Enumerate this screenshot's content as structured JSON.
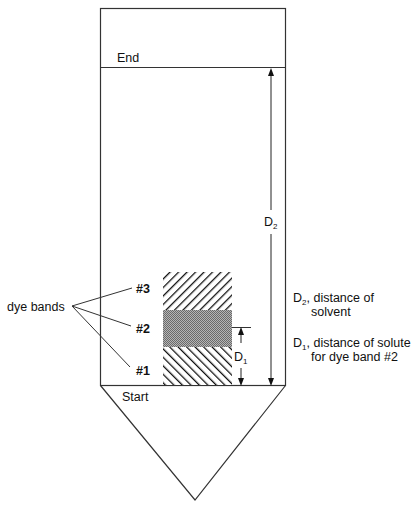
{
  "diagram": {
    "type": "paper-chromatography-strip",
    "labels": {
      "end": "End",
      "start": "Start",
      "dye_bands": "dye bands",
      "band_1": "#1",
      "band_2": "#2",
      "band_3": "#3",
      "d1_main": "D",
      "d1_sub": "1",
      "d2_main": "D",
      "d2_sub": "2"
    },
    "legend": {
      "d2_line1_main": "D",
      "d2_line1_sub": "2",
      "d2_line1_rest": ", distance of",
      "d2_line2": "solvent",
      "d1_line1_main": "D",
      "d1_line1_sub": "1",
      "d1_line1_rest": ", distance of solute",
      "d1_line2": "for dye band #2"
    },
    "colors": {
      "stroke": "#222222",
      "stipple": "#9a9a9a",
      "background": "#ffffff"
    }
  }
}
